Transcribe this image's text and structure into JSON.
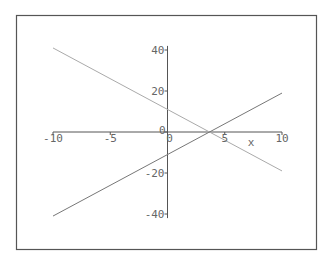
{
  "chart_data": {
    "type": "line",
    "title": "",
    "xlabel": "x",
    "ylabel": "",
    "xlim": [
      -10,
      10
    ],
    "ylim": [
      -42,
      42
    ],
    "grid": false,
    "legend": null,
    "x_ticks": [
      -10,
      -5,
      0,
      5,
      10
    ],
    "x_tick_labels": [
      "-10",
      "-5",
      "0",
      "5",
      "10"
    ],
    "y_ticks": [
      -40,
      -20,
      0,
      20,
      40
    ],
    "y_tick_labels": [
      "-40",
      "-20",
      "0",
      "20",
      "40"
    ],
    "series": [
      {
        "name": "descending line",
        "x": [
          -10,
          10
        ],
        "y": [
          41,
          -19
        ],
        "color": "#aaaaaa"
      },
      {
        "name": "ascending line",
        "x": [
          -10,
          10
        ],
        "y": [
          -41,
          19
        ],
        "color": "#777777"
      }
    ],
    "annotations": [
      {
        "text": "intersection",
        "x": 3.6,
        "y": 0
      }
    ]
  },
  "colors": {
    "frame": "#555555",
    "axis": "#555555",
    "background": "#ffffff"
  }
}
